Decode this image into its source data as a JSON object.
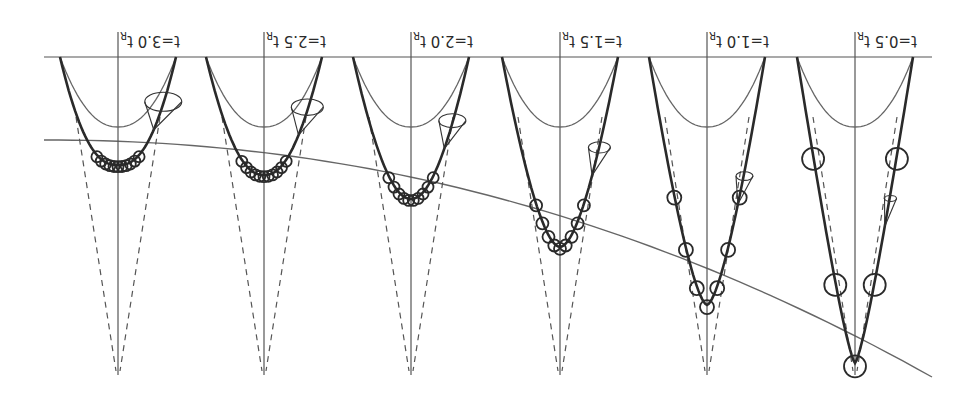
{
  "figure": {
    "orientation": "rotated 180 degrees",
    "panels": [
      {
        "id": "t05",
        "label": "t=0.5 t",
        "sub": "R",
        "loops": 5,
        "loop_size": "large"
      },
      {
        "id": "t10",
        "label": "t=1.0 t",
        "sub": "R",
        "loops": 7,
        "loop_size": "medium"
      },
      {
        "id": "t15",
        "label": "t=1.5 t",
        "sub": "R",
        "loops": 9,
        "loop_size": "small"
      },
      {
        "id": "t20",
        "label": "t=2.0 t",
        "sub": "R",
        "loops": 10,
        "loop_size": "small"
      },
      {
        "id": "t25",
        "label": "t=2.5 t",
        "sub": "R",
        "loops": 11,
        "loop_size": "small"
      },
      {
        "id": "t30",
        "label": "t=3.0 t",
        "sub": "R",
        "loops": 11,
        "loop_size": "small"
      }
    ],
    "elements": {
      "baseline": "horizontal reference line",
      "envelope_curve": "thin curve through trajectory minima",
      "guide_lines": "dashed cone lines converging to apex",
      "inner_parabola": "thin reference parabola",
      "outer_trajectory": "thick trajectory with loops",
      "cone_marker": "small precession cone glyph"
    }
  }
}
